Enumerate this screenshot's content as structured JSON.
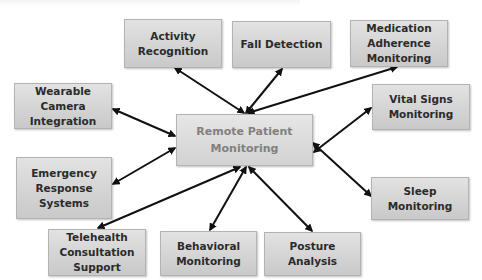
{
  "diagram": {
    "center": {
      "label": "Remote Patient\nMonitoring"
    },
    "nodes": [
      {
        "id": "activity-recognition",
        "label": "Activity\nRecognition"
      },
      {
        "id": "fall-detection",
        "label": "Fall Detection"
      },
      {
        "id": "medication-adherence-monitoring",
        "label": "Medication\nAdherence\nMonitoring"
      },
      {
        "id": "wearable-camera-integration",
        "label": "Wearable\nCamera\nIntegration"
      },
      {
        "id": "vital-signs-monitoring",
        "label": "Vital Signs\nMonitoring"
      },
      {
        "id": "emergency-response-systems",
        "label": "Emergency\nResponse\nSystems"
      },
      {
        "id": "sleep-monitoring",
        "label": "Sleep\nMonitoring"
      },
      {
        "id": "telehealth-consultation-support",
        "label": "Telehealth\nConsultation\nSupport"
      },
      {
        "id": "behavioral-monitoring",
        "label": "Behavioral\nMonitoring"
      },
      {
        "id": "posture-analysis",
        "label": "Posture\nAnalysis"
      }
    ],
    "edges": [
      {
        "from": "remote-patient-monitoring",
        "to": "activity-recognition",
        "type": "bidirectional"
      },
      {
        "from": "remote-patient-monitoring",
        "to": "fall-detection",
        "type": "bidirectional"
      },
      {
        "from": "remote-patient-monitoring",
        "to": "medication-adherence-monitoring",
        "type": "bidirectional"
      },
      {
        "from": "remote-patient-monitoring",
        "to": "wearable-camera-integration",
        "type": "bidirectional"
      },
      {
        "from": "remote-patient-monitoring",
        "to": "vital-signs-monitoring",
        "type": "bidirectional"
      },
      {
        "from": "remote-patient-monitoring",
        "to": "emergency-response-systems",
        "type": "bidirectional"
      },
      {
        "from": "remote-patient-monitoring",
        "to": "sleep-monitoring",
        "type": "bidirectional"
      },
      {
        "from": "remote-patient-monitoring",
        "to": "telehealth-consultation-support",
        "type": "bidirectional"
      },
      {
        "from": "remote-patient-monitoring",
        "to": "behavioral-monitoring",
        "type": "bidirectional"
      },
      {
        "from": "remote-patient-monitoring",
        "to": "posture-analysis",
        "type": "bidirectional"
      }
    ],
    "colors": {
      "box_fill_top": "#e2e2e2",
      "box_fill_bottom": "#c9c9c9",
      "box_text": "#2b2b2b",
      "center_text": "#808080",
      "arrow": "#111111"
    }
  }
}
